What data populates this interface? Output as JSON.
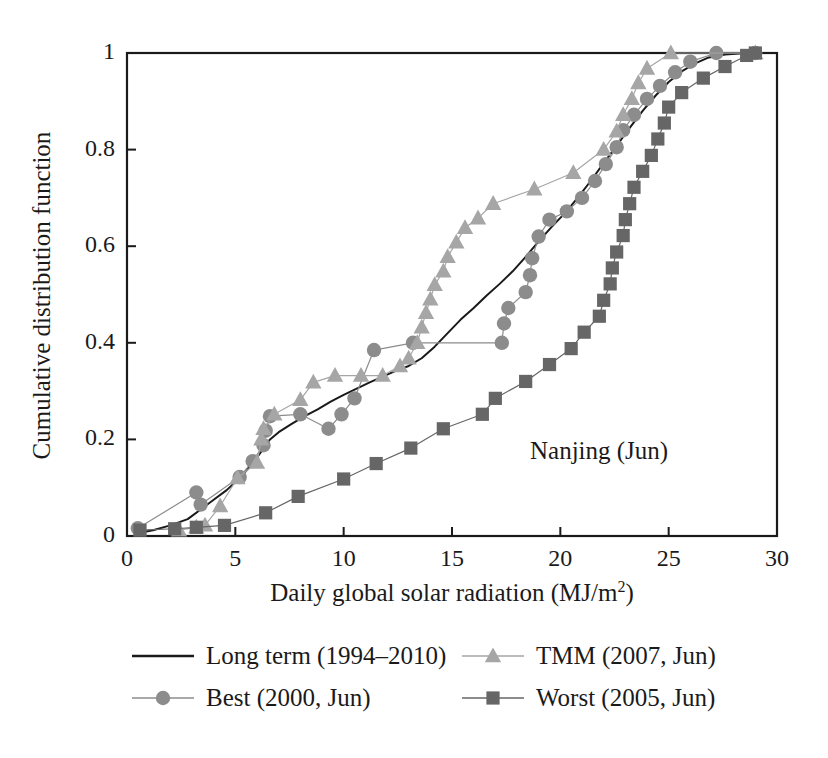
{
  "chart_data": {
    "type": "line",
    "title": "",
    "annotation": "Nanjing (Jun)",
    "xlabel": "Daily global solar radiation (MJ/m",
    "xlabel_sup": "2",
    "xlabel_close": ")",
    "xlabel_full": "Daily global solar radiation (MJ/m2)",
    "ylabel": "Cumulative distribution function",
    "xlim": [
      0,
      30
    ],
    "ylim": [
      0,
      1
    ],
    "xticks": [
      "0",
      "5",
      "10",
      "15",
      "20",
      "25",
      "30"
    ],
    "xtick_values": [
      0,
      5,
      10,
      15,
      20,
      25,
      30
    ],
    "yticks": [
      "0",
      "0.2",
      "0.4",
      "0.6",
      "0.8",
      "1"
    ],
    "ytick_values": [
      0,
      0.2,
      0.4,
      0.6,
      0.8,
      1
    ],
    "grid": false,
    "legend_position": "below-axes",
    "series": [
      {
        "name": "Long term (1994–2010)",
        "marker": "none",
        "color": "#1a1a1a",
        "linewidth": 2.0,
        "points": [
          [
            0.4,
            0.005
          ],
          [
            1.2,
            0.012
          ],
          [
            2.0,
            0.022
          ],
          [
            2.8,
            0.035
          ],
          [
            3.4,
            0.055
          ],
          [
            4.0,
            0.075
          ],
          [
            4.6,
            0.095
          ],
          [
            5.2,
            0.12
          ],
          [
            5.8,
            0.15
          ],
          [
            6.2,
            0.175
          ],
          [
            6.6,
            0.2
          ],
          [
            7.0,
            0.215
          ],
          [
            7.6,
            0.232
          ],
          [
            8.2,
            0.248
          ],
          [
            8.8,
            0.262
          ],
          [
            9.4,
            0.278
          ],
          [
            10.0,
            0.292
          ],
          [
            10.6,
            0.305
          ],
          [
            11.2,
            0.318
          ],
          [
            11.8,
            0.33
          ],
          [
            12.4,
            0.342
          ],
          [
            13.0,
            0.352
          ],
          [
            13.6,
            0.368
          ],
          [
            14.2,
            0.392
          ],
          [
            14.8,
            0.42
          ],
          [
            15.4,
            0.448
          ],
          [
            16.0,
            0.472
          ],
          [
            16.6,
            0.498
          ],
          [
            17.2,
            0.522
          ],
          [
            17.8,
            0.548
          ],
          [
            18.4,
            0.578
          ],
          [
            19.0,
            0.61
          ],
          [
            19.6,
            0.64
          ],
          [
            20.2,
            0.668
          ],
          [
            20.8,
            0.7
          ],
          [
            21.4,
            0.735
          ],
          [
            22.0,
            0.772
          ],
          [
            22.6,
            0.808
          ],
          [
            23.2,
            0.845
          ],
          [
            23.8,
            0.88
          ],
          [
            24.4,
            0.912
          ],
          [
            25.0,
            0.94
          ],
          [
            25.6,
            0.962
          ],
          [
            26.2,
            0.978
          ],
          [
            26.8,
            0.99
          ],
          [
            27.6,
            0.997
          ],
          [
            28.6,
            1.0
          ],
          [
            29.0,
            1.0
          ]
        ]
      },
      {
        "name": "Best (2000, Jun)",
        "marker": "circle",
        "color": "#8c8c8c",
        "linewidth": 1.2,
        "points": [
          [
            0.5,
            0.016
          ],
          [
            3.2,
            0.09
          ],
          [
            3.4,
            0.065
          ],
          [
            5.2,
            0.122
          ],
          [
            5.8,
            0.155
          ],
          [
            6.3,
            0.188
          ],
          [
            6.4,
            0.218
          ],
          [
            6.6,
            0.248
          ],
          [
            8.0,
            0.252
          ],
          [
            9.3,
            0.222
          ],
          [
            9.9,
            0.252
          ],
          [
            10.5,
            0.285
          ],
          [
            11.4,
            0.385
          ],
          [
            13.2,
            0.4
          ],
          [
            17.3,
            0.4
          ],
          [
            17.4,
            0.44
          ],
          [
            17.6,
            0.472
          ],
          [
            18.4,
            0.505
          ],
          [
            18.6,
            0.54
          ],
          [
            18.7,
            0.575
          ],
          [
            19.0,
            0.62
          ],
          [
            19.5,
            0.655
          ],
          [
            20.3,
            0.672
          ],
          [
            21.0,
            0.7
          ],
          [
            21.6,
            0.735
          ],
          [
            22.1,
            0.77
          ],
          [
            22.6,
            0.805
          ],
          [
            22.9,
            0.84
          ],
          [
            23.4,
            0.872
          ],
          [
            24.0,
            0.905
          ],
          [
            24.6,
            0.932
          ],
          [
            25.3,
            0.96
          ],
          [
            26.0,
            0.982
          ],
          [
            27.2,
            1.0
          ],
          [
            29.0,
            1.0
          ]
        ]
      },
      {
        "name": "TMM (2007, Jun)",
        "marker": "triangle",
        "color": "#a6a6a6",
        "linewidth": 1.2,
        "points": [
          [
            2.4,
            0.012
          ],
          [
            3.2,
            0.018
          ],
          [
            3.6,
            0.022
          ],
          [
            4.3,
            0.062
          ],
          [
            5.1,
            0.12
          ],
          [
            6.0,
            0.152
          ],
          [
            6.2,
            0.2
          ],
          [
            6.3,
            0.222
          ],
          [
            6.8,
            0.252
          ],
          [
            8.0,
            0.282
          ],
          [
            8.6,
            0.318
          ],
          [
            9.6,
            0.332
          ],
          [
            10.8,
            0.332
          ],
          [
            11.8,
            0.332
          ],
          [
            12.6,
            0.352
          ],
          [
            13.0,
            0.368
          ],
          [
            13.4,
            0.4
          ],
          [
            13.6,
            0.432
          ],
          [
            13.8,
            0.462
          ],
          [
            14.0,
            0.49
          ],
          [
            14.2,
            0.52
          ],
          [
            14.6,
            0.548
          ],
          [
            14.8,
            0.578
          ],
          [
            15.2,
            0.608
          ],
          [
            15.6,
            0.638
          ],
          [
            16.2,
            0.658
          ],
          [
            16.9,
            0.688
          ],
          [
            18.8,
            0.718
          ],
          [
            20.6,
            0.752
          ],
          [
            22.0,
            0.8
          ],
          [
            22.6,
            0.838
          ],
          [
            22.9,
            0.872
          ],
          [
            23.3,
            0.905
          ],
          [
            23.6,
            0.938
          ],
          [
            24.0,
            0.968
          ],
          [
            25.1,
            1.0
          ],
          [
            29.0,
            1.0
          ]
        ]
      },
      {
        "name": "Worst (2005, Jun)",
        "marker": "square",
        "color": "#666666",
        "linewidth": 1.2,
        "points": [
          [
            0.6,
            0.012
          ],
          [
            2.2,
            0.015
          ],
          [
            3.2,
            0.018
          ],
          [
            4.5,
            0.022
          ],
          [
            6.4,
            0.048
          ],
          [
            7.9,
            0.082
          ],
          [
            10.0,
            0.118
          ],
          [
            11.5,
            0.15
          ],
          [
            13.1,
            0.182
          ],
          [
            14.6,
            0.222
          ],
          [
            16.4,
            0.252
          ],
          [
            17.0,
            0.285
          ],
          [
            18.4,
            0.32
          ],
          [
            19.5,
            0.355
          ],
          [
            20.5,
            0.388
          ],
          [
            21.1,
            0.422
          ],
          [
            21.8,
            0.455
          ],
          [
            22.0,
            0.488
          ],
          [
            22.3,
            0.522
          ],
          [
            22.4,
            0.555
          ],
          [
            22.6,
            0.588
          ],
          [
            22.9,
            0.622
          ],
          [
            23.0,
            0.655
          ],
          [
            23.2,
            0.688
          ],
          [
            23.4,
            0.722
          ],
          [
            23.8,
            0.755
          ],
          [
            24.2,
            0.788
          ],
          [
            24.5,
            0.822
          ],
          [
            24.8,
            0.855
          ],
          [
            25.0,
            0.888
          ],
          [
            25.6,
            0.918
          ],
          [
            26.6,
            0.948
          ],
          [
            27.6,
            0.972
          ],
          [
            28.6,
            0.995
          ],
          [
            29.0,
            1.0
          ]
        ]
      }
    ]
  },
  "legend": {
    "items": [
      {
        "label": "Long term (1994–2010)",
        "marker": "none",
        "color": "#1a1a1a"
      },
      {
        "label": "Best (2000, Jun)",
        "marker": "circle",
        "color": "#8c8c8c"
      },
      {
        "label": "TMM (2007, Jun)",
        "marker": "triangle",
        "color": "#a6a6a6"
      },
      {
        "label": "Worst (2005, Jun)",
        "marker": "square",
        "color": "#666666"
      }
    ]
  },
  "colors": {
    "axis": "#1a1a1a",
    "text": "#1a1a1a",
    "background": "#ffffff",
    "long_term": "#1a1a1a",
    "best": "#8c8c8c",
    "tmm": "#a6a6a6",
    "worst": "#666666"
  }
}
